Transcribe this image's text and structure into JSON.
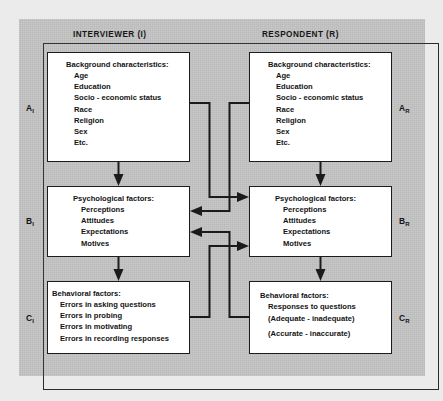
{
  "figure": {
    "panel_color": "#c4c4c4",
    "box_fill": "#ffffff",
    "line_color": "#1b1b1b"
  },
  "headers": {
    "interviewer": "INTERVIEWER (I)",
    "respondent": "RESPONDENT (R)"
  },
  "side_labels": {
    "a_i": {
      "base": "A",
      "sub": "I"
    },
    "b_i": {
      "base": "B",
      "sub": "I"
    },
    "c_i": {
      "base": "C",
      "sub": "I"
    },
    "a_r": {
      "base": "A",
      "sub": "R"
    },
    "b_r": {
      "base": "B",
      "sub": "R"
    },
    "c_r": {
      "base": "C",
      "sub": "R"
    }
  },
  "boxes": {
    "a_i": {
      "title": "Background characteristics:",
      "items": [
        "Age",
        "Education",
        "Socio - economic status",
        "Race",
        "Religion",
        "Sex",
        "Etc."
      ]
    },
    "a_r": {
      "title": "Background characteristics:",
      "items": [
        "Age",
        "Education",
        "Socio - economic status",
        "Race",
        "Religion",
        "Sex",
        "Etc."
      ]
    },
    "b_i": {
      "title": "Psychological factors:",
      "items": [
        "Perceptions",
        "Attitudes",
        "Expectations",
        "Motives"
      ]
    },
    "b_r": {
      "title": "Psychological factors:",
      "items": [
        "Perceptions",
        "Attitudes",
        "Expectations",
        "Motives"
      ]
    },
    "c_i": {
      "title": "Behavioral factors:",
      "items": [
        "Errors in asking questions",
        "Errors in probing",
        "Errors in motivating",
        "Errors in recording responses"
      ]
    },
    "c_r": {
      "title": "Behavioral factors:",
      "items": [
        "Responses to questions",
        "(Adequate - inadequate)",
        "(Accurate - inaccurate)"
      ]
    }
  }
}
